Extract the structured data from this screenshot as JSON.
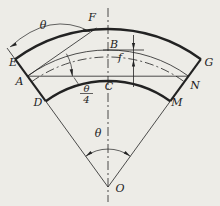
{
  "figure": {
    "colors": {
      "background": "#edece7",
      "line": "#222222"
    },
    "point_labels": {
      "E": "E",
      "F": "F",
      "G": "G",
      "A": "A",
      "B": "B",
      "C": "C",
      "D": "D",
      "N": "N",
      "M": "M",
      "O": "O"
    },
    "angle_labels": {
      "top_theta": "θ",
      "bottom_theta": "θ",
      "quarter_numerator": "θ",
      "quarter_denominator": "4"
    },
    "dimension_labels": {
      "deflection": "f"
    }
  }
}
